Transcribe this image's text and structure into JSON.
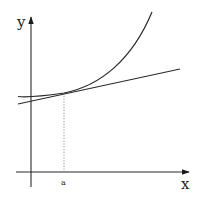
{
  "diagram": {
    "labels": {
      "y_axis": "y",
      "x_axis": "x",
      "point": "a"
    },
    "colors": {
      "stroke": "#2a2a2a",
      "dotted": "#888888",
      "background": "#ffffff"
    },
    "elements": [
      {
        "name": "y-axis",
        "type": "arrow",
        "from": [
          31,
          187
        ],
        "to": [
          31,
          16
        ]
      },
      {
        "name": "x-axis",
        "type": "arrow",
        "from": [
          16,
          172
        ],
        "to": [
          190,
          172
        ]
      },
      {
        "name": "curve",
        "type": "convex-curve",
        "points": [
          [
            18,
            96
          ],
          [
            35,
            96
          ],
          [
            64,
            93
          ],
          [
            152,
            12
          ]
        ]
      },
      {
        "name": "tangent-line",
        "type": "line",
        "from": [
          18,
          104
        ],
        "to": [
          180,
          69
        ]
      },
      {
        "name": "tangent-point-drop",
        "type": "dotted-line",
        "from": [
          64,
          93
        ],
        "to": [
          64,
          172
        ]
      }
    ]
  }
}
